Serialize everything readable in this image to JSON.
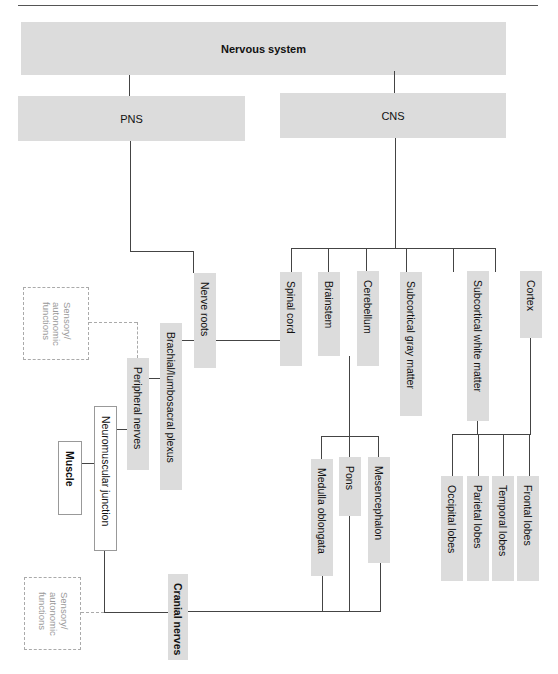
{
  "diagram": {
    "title": "Nervous system",
    "level1": {
      "pns": "PNS",
      "cns": "CNS"
    },
    "cns_children": [
      "Spinal cord",
      "Brainstem",
      "Cerebellum",
      "Subcortical gray matter",
      "Subcortical white matter",
      "Cortex"
    ],
    "brainstem_children": [
      "Medulla oblongata",
      "Pons",
      "Mesencephalon"
    ],
    "cortex_children": [
      "Occipital lobes",
      "Parietal lobes",
      "Temporal lobes",
      "Frontal lobes"
    ],
    "pns_chain": {
      "nerve_roots": "Nerve roots",
      "plexus": "Brachial/lumbosacral plexus",
      "peripheral_nerves": "Peripheral nerves",
      "neuromuscular_junction": "Neuromuscular junction",
      "muscle": "Muscle",
      "cranial_nerves": "Cranial nerves"
    },
    "sensory_labels": [
      "Sensory/\nautonomic\nfunctions",
      "Sensory/\nautonomic\nfunctions"
    ]
  }
}
